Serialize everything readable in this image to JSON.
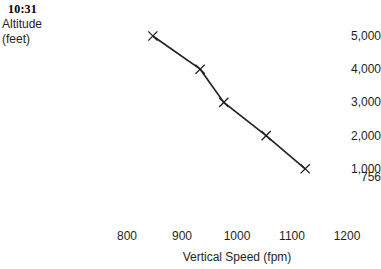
{
  "annotations": {
    "time_stamp": "10:31"
  },
  "chart_data": {
    "type": "line",
    "title": "",
    "subtitle": "",
    "xlabel": "Vertical Speed (fpm)",
    "ylabel": "Altitude (feet)",
    "ylabel_lines": [
      "Altitude",
      "(feet)"
    ],
    "xlim": [
      800,
      1200
    ],
    "ylim": [
      756,
      5000
    ],
    "grid": false,
    "legend": null,
    "axis_lines_visible": false,
    "marker": "x",
    "line_color": "#231f20",
    "marker_color": "#231f20",
    "x_ticks": [
      {
        "value": 800,
        "label": "800"
      },
      {
        "value": 900,
        "label": "900"
      },
      {
        "value": 1000,
        "label": "1000"
      },
      {
        "value": 1100,
        "label": "1100"
      },
      {
        "value": 1200,
        "label": "1200"
      }
    ],
    "y_ticks": [
      {
        "value": 5000,
        "label": "5,000"
      },
      {
        "value": 4000,
        "label": "4,000"
      },
      {
        "value": 3000,
        "label": "3,000"
      },
      {
        "value": 2000,
        "label": "2,000"
      },
      {
        "value": 1000,
        "label": "1,000"
      },
      {
        "value": 756,
        "label": "756"
      }
    ],
    "series": [
      {
        "name": "Altitude vs Vertical Speed",
        "x": [
          847,
          933,
          976,
          1053,
          1124
        ],
        "y": [
          5000,
          4000,
          3000,
          2000,
          1000
        ],
        "points": [
          {
            "x": 847,
            "y": 5000
          },
          {
            "x": 933,
            "y": 4000
          },
          {
            "x": 976,
            "y": 3000
          },
          {
            "x": 1053,
            "y": 2000
          },
          {
            "x": 1124,
            "y": 1000
          }
        ]
      }
    ]
  }
}
